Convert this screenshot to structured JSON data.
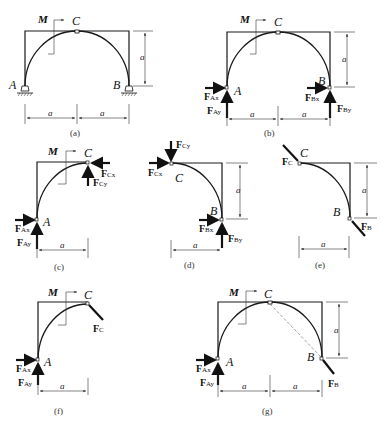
{
  "panels": [
    {
      "id": "a",
      "caption": "(a)"
    },
    {
      "id": "b",
      "caption": "(b)"
    },
    {
      "id": "c",
      "caption": "(c)"
    },
    {
      "id": "d",
      "caption": "(d)"
    },
    {
      "id": "e",
      "caption": "(e)"
    },
    {
      "id": "f",
      "caption": "(f)"
    },
    {
      "id": "g",
      "caption": "(g)"
    }
  ],
  "labels": {
    "A": "A",
    "B": "B",
    "C": "C",
    "M": "M",
    "dim": "a",
    "F": "F",
    "Ax": "Ax",
    "Ay": "Ay",
    "Bx": "Bx",
    "By": "By",
    "Cx": "Cx",
    "Cy": "Cy",
    "FC_sub": "C",
    "FB_sub": "B"
  },
  "colors": {
    "line": "#1a1a1a",
    "force": "#111111",
    "dashed": "#888888"
  }
}
